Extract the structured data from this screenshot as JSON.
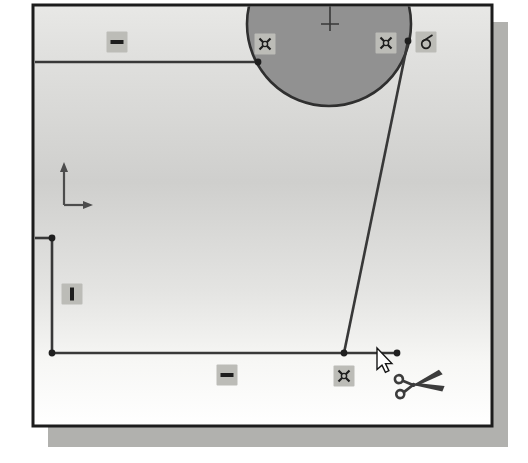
{
  "app": {
    "view": "cad-sketch-viewport",
    "active_tool": "trim-entities"
  },
  "colors": {
    "frame_border": "#1c1c1c",
    "shadow": "#b1b1ae",
    "line": "#383838",
    "point": "#1f1f1f",
    "circle_fill": "#919191",
    "circle_stroke": "#2f2f2f",
    "badge_bg": "#bcbcb7",
    "glyph": "#1d1d1d",
    "origin": "#4c4c4c",
    "cursor_fill": "#ffffff",
    "cursor_stroke": "#151515",
    "scissors": "#3c3c3c"
  },
  "sketch": {
    "frame": {
      "x": 33,
      "y": 5,
      "width": 459,
      "height": 421
    },
    "shadow": {
      "x": 48,
      "y": 22,
      "width": 460,
      "height": 425
    },
    "background_stops": [
      {
        "offset": "0%",
        "color": "#e8e8e6"
      },
      {
        "offset": "12%",
        "color": "#e0e0de"
      },
      {
        "offset": "42%",
        "color": "#cfcfcd"
      },
      {
        "offset": "68%",
        "color": "#e4e4e2"
      },
      {
        "offset": "85%",
        "color": "#f7f7f5"
      },
      {
        "offset": "100%",
        "color": "#ffffff"
      }
    ],
    "circle": {
      "cx": 329,
      "cy": 24,
      "r": 82
    },
    "center_mark": {
      "x": 330,
      "stem_top": 6,
      "stem_bottom": 31,
      "cross_y": 24,
      "arm": 9
    },
    "lines": [
      {
        "name": "top-horizontal-line",
        "x1": 35,
        "y1": 62,
        "x2": 258,
        "y2": 62
      },
      {
        "name": "left-stub-line",
        "x1": 35,
        "y1": 238,
        "x2": 52,
        "y2": 238
      },
      {
        "name": "left-vertical-line",
        "x1": 52,
        "y1": 238,
        "x2": 52,
        "y2": 353
      },
      {
        "name": "bottom-horizontal-line",
        "x1": 52,
        "y1": 353,
        "x2": 397,
        "y2": 353
      },
      {
        "name": "slanted-line",
        "x1": 408,
        "y1": 41,
        "x2": 344,
        "y2": 353
      }
    ],
    "points": [
      {
        "x": 258,
        "y": 62
      },
      {
        "x": 408,
        "y": 41
      },
      {
        "x": 52,
        "y": 238
      },
      {
        "x": 52,
        "y": 353
      },
      {
        "x": 344,
        "y": 353
      },
      {
        "x": 397,
        "y": 353
      }
    ],
    "origin": {
      "x": 64,
      "y": 205,
      "up_len": 42,
      "right_len": 26
    },
    "badges": [
      {
        "relation": "horizontal",
        "icon": "horizontal-relation-icon",
        "cx": 117,
        "cy": 42
      },
      {
        "relation": "coincident",
        "icon": "coincident-relation-icon",
        "cx": 265,
        "cy": 44
      },
      {
        "relation": "coincident",
        "icon": "coincident-relation-icon",
        "cx": 386,
        "cy": 43
      },
      {
        "relation": "tangent",
        "icon": "tangent-relation-icon",
        "cx": 426,
        "cy": 42
      },
      {
        "relation": "vertical",
        "icon": "vertical-relation-icon",
        "cx": 72,
        "cy": 294
      },
      {
        "relation": "horizontal",
        "icon": "horizontal-relation-icon",
        "cx": 227,
        "cy": 375
      },
      {
        "relation": "coincident",
        "icon": "coincident-relation-icon",
        "cx": 344,
        "cy": 376
      }
    ],
    "badge_size": 21,
    "cursor": {
      "tip_x": 377,
      "tip_y": 348
    },
    "scissors": {
      "x": 413,
      "y": 385,
      "rotation": -9
    }
  }
}
